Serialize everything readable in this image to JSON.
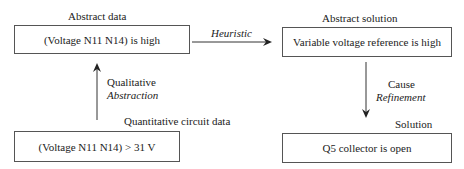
{
  "nodes": {
    "abstract_data": {
      "title": "Abstract data",
      "text": "(Voltage N11 N14) is high"
    },
    "abstract_solution": {
      "title": "Abstract solution",
      "text": "Variable voltage reference is high"
    },
    "quantitative_data": {
      "title": "Quantitative circuit data",
      "text": "(Voltage N11 N14) > 31 V"
    },
    "solution": {
      "title": "Solution",
      "text": "Q5 collector is open"
    }
  },
  "edges": {
    "heuristic": {
      "label": "Heuristic"
    },
    "abstraction": {
      "label_line1": "Qualitative",
      "label_line2": "Abstraction"
    },
    "refinement": {
      "label_line1": "Cause",
      "label_line2": "Refinement"
    }
  },
  "colors": {
    "line": "#333333",
    "border": "#555555",
    "text": "#222222"
  }
}
